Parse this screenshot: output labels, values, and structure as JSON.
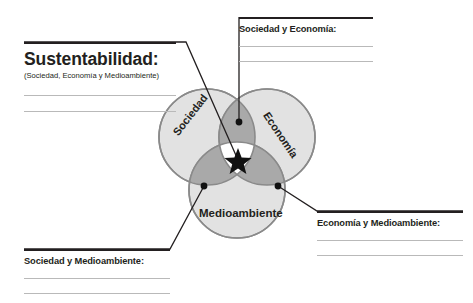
{
  "diagram": {
    "type": "venn-3-circle",
    "circles": [
      {
        "name": "sociedad",
        "label": "Sociedad",
        "cx": 207,
        "cy": 137,
        "r": 48,
        "fill": "#e2e2e2"
      },
      {
        "name": "economia",
        "label": "Economía",
        "cx": 267,
        "cy": 137,
        "r": 48,
        "fill": "#e2e2e2"
      },
      {
        "name": "medioambiente",
        "label": "Medioambiente",
        "cx": 237,
        "cy": 190,
        "r": 48,
        "fill": "#e2e2e2"
      }
    ],
    "intersection_fill": "#a9a9a9",
    "center_fill": "#ffffff",
    "stroke": "#8a8a8a",
    "center_marker": "star"
  },
  "blocks": {
    "sustentabilidad": {
      "title": "Sustentabilidad:",
      "subtitle": "(Sociedad, Economía y Medioambiente)",
      "blank_lines": 2
    },
    "sociedad_economia": {
      "title": "Sociedad y Economía:",
      "blank_lines": 2
    },
    "economia_medioambiente": {
      "title": "Economía y Medioambiente:",
      "blank_lines": 2
    },
    "sociedad_medioambiente": {
      "title": "Sociedad y Medioambiente:",
      "blank_lines": 2
    }
  },
  "colors": {
    "ink": "#231f20",
    "rule_dark": "#231f20",
    "rule_light": "#b9b9b9",
    "circle_light": "#e2e2e2",
    "circle_overlap": "#a9a9a9",
    "circle_stroke": "#8a8a8a"
  }
}
